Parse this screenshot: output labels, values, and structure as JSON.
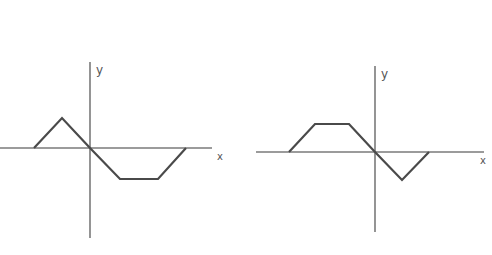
{
  "graphs": [
    {
      "id": "left",
      "x_label": "x",
      "y_label": "y",
      "origin": [
        90,
        148
      ],
      "x_axis": [
        0,
        212
      ],
      "y_axis": [
        62,
        238
      ],
      "points": [
        [
          34,
          148
        ],
        [
          62,
          118
        ],
        [
          90,
          148
        ],
        [
          120,
          179
        ],
        [
          158,
          179
        ],
        [
          186,
          148
        ]
      ]
    },
    {
      "id": "right",
      "x_label": "x",
      "y_label": "y",
      "origin": [
        375,
        152
      ],
      "x_axis": [
        256,
        484
      ],
      "y_axis": [
        66,
        232
      ],
      "points": [
        [
          289,
          152
        ],
        [
          315,
          124
        ],
        [
          349,
          124
        ],
        [
          375,
          152
        ],
        [
          402,
          180
        ],
        [
          429,
          152
        ]
      ]
    }
  ],
  "colors": {
    "axis": "#7a7a7a",
    "curve": "#4a4a4a",
    "label": "#555555"
  }
}
